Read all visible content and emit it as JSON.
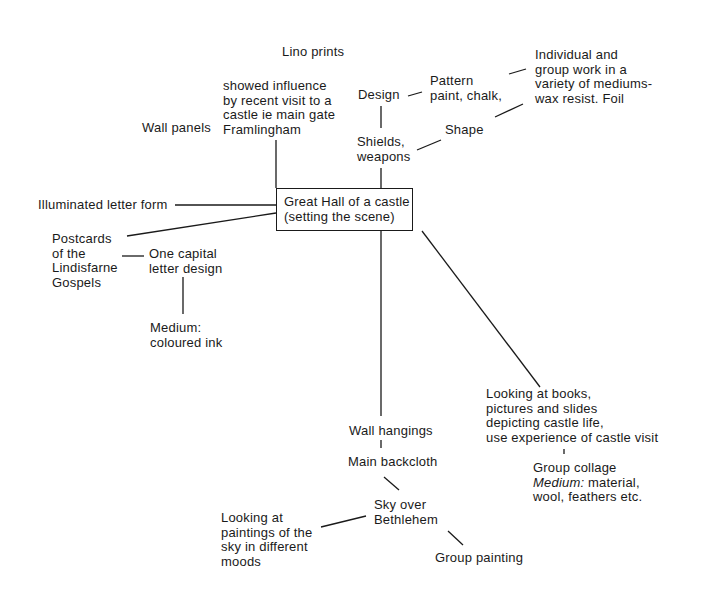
{
  "diagram": {
    "center": {
      "line1": "Great Hall of a castle",
      "line2": "(setting the scene)"
    },
    "nodes": {
      "lino_prints": "Lino prints",
      "influence": "showed influence\nby recent visit to a\ncastle ie main gate\nFramlingham",
      "wall_panels": "Wall panels",
      "design": "Design",
      "pattern": "Pattern\npaint, chalk,",
      "individual": "Individual and\ngroup work in a\nvariety of mediums-\nwax resist. Foil",
      "shape": "Shape",
      "shields": "Shields,\nweapons",
      "illuminated": "Illuminated letter form",
      "postcards": "Postcards\nof the\nLindisfarne\nGospels",
      "capital": "One capital\nletter design",
      "medium_ink": "Medium:\ncoloured ink",
      "looking_books": "Looking at books,\npictures and slides\ndepicting castle life,\nuse experience of castle visit",
      "group_collage": "Group collage",
      "collage_medium_label": "Medium:",
      "collage_medium_value": " material,",
      "collage_medium_line3": "wool, feathers etc.",
      "wall_hangings": "Wall hangings",
      "main_backcloth": "Main backcloth",
      "sky": "Sky over\nBethlehem",
      "looking_paintings": "Looking at\npaintings of the\nsky in different\nmoods",
      "group_painting": "Group painting"
    }
  }
}
